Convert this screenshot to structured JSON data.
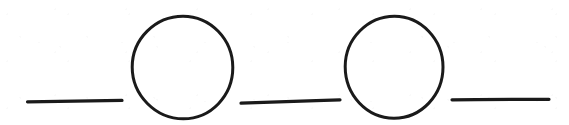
{
  "figure": {
    "kind": "hand-drawn-line-diagram",
    "background_color": "#ffffff",
    "ink_color": "#1a1a1a",
    "canvas": {
      "width": 569,
      "height": 125
    },
    "element_count": 5,
    "elements": [
      {
        "index": 0,
        "type": "line",
        "name": "left-dash",
        "x1": 27.5,
        "y1": 101.5,
        "x2": 122.0,
        "y2": 100.5,
        "stroke_width": 3.2,
        "color": "#1a1a1a"
      },
      {
        "index": 1,
        "type": "circle",
        "name": "first-circle",
        "cx": 182.5,
        "cy": 67.5,
        "rx": 50.5,
        "ry": 51.5,
        "left": 132,
        "right": 233,
        "top": 16,
        "bottom": 119,
        "stroke_width": 3.0,
        "color": "#1a1a1a"
      },
      {
        "index": 2,
        "type": "line",
        "name": "middle-dash",
        "x1": 241.0,
        "y1": 103.0,
        "x2": 340.0,
        "y2": 100.0,
        "stroke_width": 3.2,
        "color": "#1a1a1a"
      },
      {
        "index": 3,
        "type": "circle",
        "name": "second-circle",
        "cx": 394.0,
        "cy": 67.0,
        "rx": 49.0,
        "ry": 51.0,
        "left": 345,
        "right": 443,
        "top": 16,
        "bottom": 118,
        "stroke_width": 3.0,
        "color": "#1a1a1a"
      },
      {
        "index": 4,
        "type": "line",
        "name": "right-dash",
        "x1": 452.0,
        "y1": 99.5,
        "x2": 549.0,
        "y2": 99.5,
        "stroke_width": 3.2,
        "color": "#1a1a1a"
      }
    ]
  }
}
